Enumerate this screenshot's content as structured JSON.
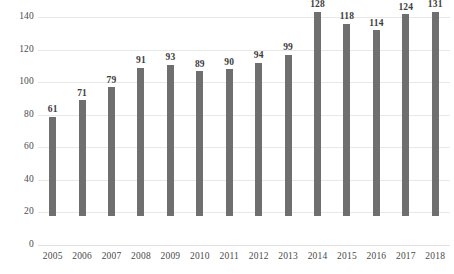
{
  "chart_data": {
    "type": "bar",
    "title": "",
    "subtitle": "",
    "xlabel": "",
    "ylabel": "",
    "categories": [
      "2005",
      "2006",
      "2007",
      "2008",
      "2009",
      "2010",
      "2011",
      "2012",
      "2013",
      "2014",
      "2015",
      "2016",
      "2017",
      "2018"
    ],
    "values": [
      61,
      71,
      79,
      91,
      93,
      89,
      90,
      94,
      99,
      128,
      118,
      114,
      124,
      131
    ],
    "data_labels": [
      "61",
      "71",
      "79",
      "91",
      "93",
      "89",
      "90",
      "94",
      "99",
      "128",
      "118",
      "114",
      "124",
      "131"
    ],
    "ylim": [
      0,
      140
    ],
    "ytick_values": [
      0,
      20,
      40,
      60,
      80,
      100,
      120,
      140
    ],
    "ytick_labels": [
      "0",
      "20",
      "40",
      "60",
      "80",
      "100",
      "120",
      "140"
    ],
    "grid": true,
    "grid_axis": "y",
    "legend": false,
    "legend_position": "none",
    "bar_color": "#6f6f6f",
    "grid_color": "#e8e8e8",
    "text_color": "#4a4a4a",
    "label_color": "#3d3d3d",
    "background_color": "#ffffff"
  }
}
